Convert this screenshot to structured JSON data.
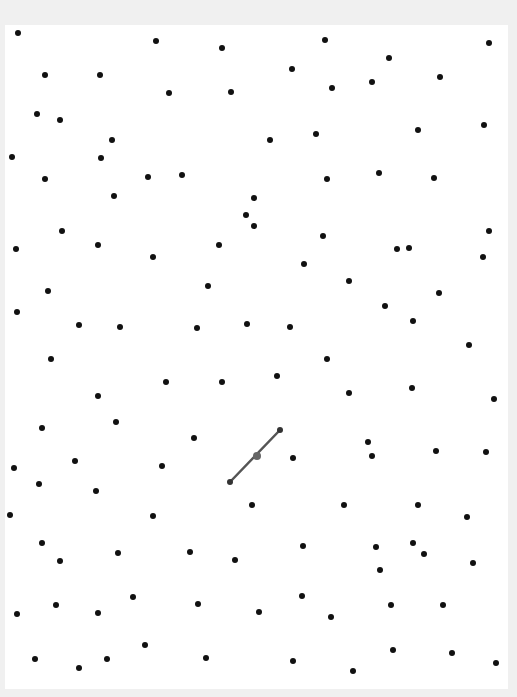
{
  "canvas": {
    "background": "#ffffff",
    "frame_color": "#f0f0f0",
    "dot_color": "#111111",
    "segment_color": "#555555"
  },
  "segment": {
    "start": [
      230,
      482
    ],
    "end": [
      280,
      430
    ],
    "midpoint": [
      257,
      456
    ]
  },
  "dots": [
    [
      18,
      33
    ],
    [
      156,
      41
    ],
    [
      222,
      48
    ],
    [
      325,
      40
    ],
    [
      489,
      43
    ],
    [
      45,
      75
    ],
    [
      100,
      75
    ],
    [
      169,
      93
    ],
    [
      231,
      92
    ],
    [
      292,
      69
    ],
    [
      389,
      58
    ],
    [
      372,
      82
    ],
    [
      332,
      88
    ],
    [
      440,
      77
    ],
    [
      37,
      114
    ],
    [
      60,
      120
    ],
    [
      112,
      140
    ],
    [
      270,
      140
    ],
    [
      316,
      134
    ],
    [
      418,
      130
    ],
    [
      484,
      125
    ],
    [
      12,
      157
    ],
    [
      101,
      158
    ],
    [
      45,
      179
    ],
    [
      148,
      177
    ],
    [
      182,
      175
    ],
    [
      327,
      179
    ],
    [
      379,
      173
    ],
    [
      434,
      178
    ],
    [
      114,
      196
    ],
    [
      254,
      198
    ],
    [
      246,
      215
    ],
    [
      254,
      226
    ],
    [
      62,
      231
    ],
    [
      16,
      249
    ],
    [
      98,
      245
    ],
    [
      153,
      257
    ],
    [
      219,
      245
    ],
    [
      323,
      236
    ],
    [
      397,
      249
    ],
    [
      409,
      248
    ],
    [
      489,
      231
    ],
    [
      483,
      257
    ],
    [
      304,
      264
    ],
    [
      48,
      291
    ],
    [
      208,
      286
    ],
    [
      349,
      281
    ],
    [
      439,
      293
    ],
    [
      17,
      312
    ],
    [
      79,
      325
    ],
    [
      120,
      327
    ],
    [
      197,
      328
    ],
    [
      247,
      324
    ],
    [
      290,
      327
    ],
    [
      385,
      306
    ],
    [
      413,
      321
    ],
    [
      51,
      359
    ],
    [
      327,
      359
    ],
    [
      469,
      345
    ],
    [
      98,
      396
    ],
    [
      166,
      382
    ],
    [
      222,
      382
    ],
    [
      277,
      376
    ],
    [
      349,
      393
    ],
    [
      412,
      388
    ],
    [
      494,
      399
    ],
    [
      42,
      428
    ],
    [
      116,
      422
    ],
    [
      194,
      438
    ],
    [
      368,
      442
    ],
    [
      372,
      456
    ],
    [
      436,
      451
    ],
    [
      486,
      452
    ],
    [
      14,
      468
    ],
    [
      75,
      461
    ],
    [
      162,
      466
    ],
    [
      293,
      458
    ],
    [
      39,
      484
    ],
    [
      96,
      491
    ],
    [
      10,
      515
    ],
    [
      153,
      516
    ],
    [
      252,
      505
    ],
    [
      344,
      505
    ],
    [
      418,
      505
    ],
    [
      467,
      517
    ],
    [
      42,
      543
    ],
    [
      60,
      561
    ],
    [
      118,
      553
    ],
    [
      190,
      552
    ],
    [
      235,
      560
    ],
    [
      303,
      546
    ],
    [
      376,
      547
    ],
    [
      413,
      543
    ],
    [
      424,
      554
    ],
    [
      380,
      570
    ],
    [
      473,
      563
    ],
    [
      17,
      614
    ],
    [
      56,
      605
    ],
    [
      98,
      613
    ],
    [
      133,
      597
    ],
    [
      198,
      604
    ],
    [
      259,
      612
    ],
    [
      302,
      596
    ],
    [
      331,
      617
    ],
    [
      391,
      605
    ],
    [
      443,
      605
    ],
    [
      35,
      659
    ],
    [
      79,
      668
    ],
    [
      107,
      659
    ],
    [
      145,
      645
    ],
    [
      206,
      658
    ],
    [
      293,
      661
    ],
    [
      353,
      671
    ],
    [
      393,
      650
    ],
    [
      452,
      653
    ],
    [
      496,
      663
    ]
  ]
}
